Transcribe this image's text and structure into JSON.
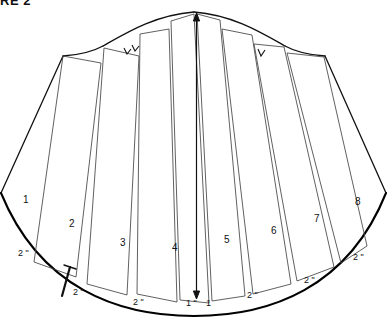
{
  "figure": {
    "caption": "RE 2",
    "hem_arc_label": "hem-arc",
    "top_curve_label": "upper-contour"
  },
  "panels": [
    {
      "id": "panel-1",
      "number": "1",
      "x": 23,
      "y": 195
    },
    {
      "id": "panel-2",
      "number": "2",
      "x": 69,
      "y": 219
    },
    {
      "id": "panel-3",
      "number": "3",
      "x": 120,
      "y": 238
    },
    {
      "id": "panel-4",
      "number": "4",
      "x": 172,
      "y": 243
    },
    {
      "id": "panel-5",
      "number": "5",
      "x": 224,
      "y": 235
    },
    {
      "id": "panel-6",
      "number": "6",
      "x": 271,
      "y": 226
    },
    {
      "id": "panel-7",
      "number": "7",
      "x": 314,
      "y": 214
    },
    {
      "id": "panel-8",
      "number": "8",
      "x": 355,
      "y": 197
    }
  ],
  "gaps": [
    {
      "id": "gap-left-outer",
      "value": "2 \"",
      "x": 18,
      "y": 249
    },
    {
      "id": "gap-1-2",
      "value": "2 \"",
      "x": 73,
      "y": 288
    },
    {
      "id": "gap-2-3",
      "value": "2 \"",
      "x": 133,
      "y": 298
    },
    {
      "id": "gap-3-4",
      "value": "2 \"",
      "x": 192,
      "y": 299
    },
    {
      "id": "gap-center-left",
      "value": "1 \"",
      "x": 186,
      "y": 299
    },
    {
      "id": "gap-center-right",
      "value": "1",
      "x": 206,
      "y": 299
    },
    {
      "id": "gap-5-6",
      "value": "2 \"",
      "x": 247,
      "y": 291
    },
    {
      "id": "gap-6-7",
      "value": "2 \"",
      "x": 304,
      "y": 276
    },
    {
      "id": "gap-7-8",
      "value": "2 \"",
      "x": 353,
      "y": 253
    }
  ],
  "markers": {
    "grainline": "center-grainline-arrow",
    "notch_left": "double-notch",
    "notch_right": "single-notch",
    "measure_tick": "spread-measure-tick"
  },
  "colors": {
    "ink": "#111111",
    "line": "#333333",
    "paper": "#ffffff",
    "heavy": "#000000"
  }
}
